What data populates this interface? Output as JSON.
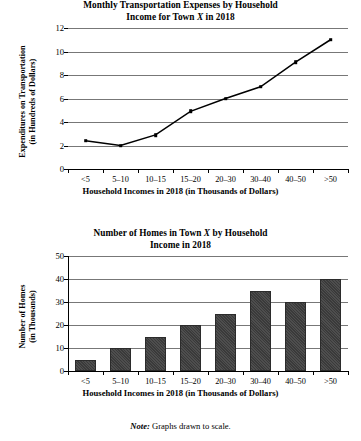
{
  "note": {
    "prefix": "Note:",
    "text": " Graphs drawn to scale."
  },
  "chart_data": [
    {
      "type": "line",
      "title_line1": "Monthly Transportation Expenses by Household",
      "title_line2_pre": "Income for Town ",
      "title_line2_ital": "X",
      "title_line2_post": " in 2018",
      "title_full": "Monthly Transportation Expenses by Household Income for Town X in 2018",
      "ylabel_line1": "Expenditures on Transportation",
      "ylabel_line2": "(in Hundreds of Dollars)",
      "xlabel": "Household Incomes in 2018 (in Thousands of Dollars)",
      "categories": [
        "<5",
        "5–10",
        "10–15",
        "15–20",
        "20–30",
        "30–40",
        "40–50",
        ">50"
      ],
      "values": [
        2.4,
        2.0,
        2.9,
        4.9,
        6.0,
        7.0,
        9.1,
        11.0
      ],
      "yticks": [
        0,
        2,
        4,
        6,
        8,
        10,
        12
      ],
      "ylim": [
        0,
        12
      ],
      "grid": true,
      "legend": "none"
    },
    {
      "type": "bar",
      "title_line1_pre": "Number of Homes in Town ",
      "title_line1_ital": "X",
      "title_line1_post": " by Household",
      "title_line2": "Income in 2018",
      "title_full": "Number of Homes in Town X by Household Income in 2018",
      "ylabel_line1": "Number of Homes",
      "ylabel_line2": "(in Thousands)",
      "xlabel": "Household Incomes in 2018 (in Thousands of Dollars)",
      "categories": [
        "<5",
        "5–10",
        "10–15",
        "15–20",
        "20–30",
        "30–40",
        "40–50",
        ">50"
      ],
      "values": [
        5,
        10,
        15,
        20,
        25,
        35,
        30,
        40
      ],
      "yticks": [
        0,
        10,
        20,
        30,
        40,
        50
      ],
      "ylim": [
        0,
        50
      ],
      "grid": true,
      "legend": "none"
    }
  ]
}
